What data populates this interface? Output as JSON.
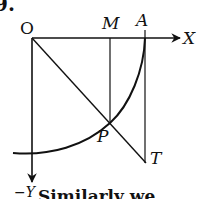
{
  "problem_number": "9.",
  "labels": {
    "origin": "O",
    "x_axis": "X",
    "neg_y_axis": "−Y",
    "point_M": "M",
    "point_A": "A",
    "point_P": "P",
    "point_T": "T"
  },
  "caption_fragment": "Similarly we",
  "colors": {
    "stroke": "#111111",
    "background": "#ffffff"
  },
  "geometry": {
    "origin": [
      32,
      38
    ],
    "A": [
      145,
      38
    ],
    "M": [
      110,
      38
    ],
    "P": [
      110,
      123
    ],
    "T": [
      146,
      163
    ],
    "x_axis_end": [
      180,
      38
    ],
    "y_axis_end": [
      32,
      182
    ]
  }
}
